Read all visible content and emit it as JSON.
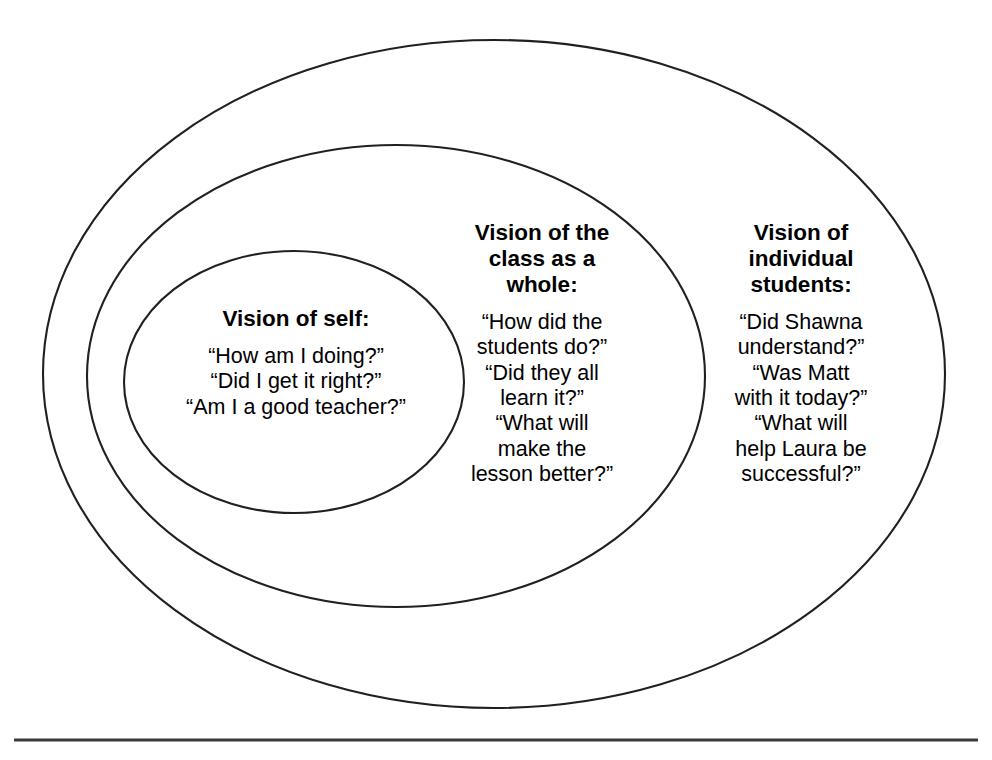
{
  "diagram": {
    "type": "nested-ellipses",
    "title_present": false,
    "stroke_color": "#231f20",
    "background_color": "#ffffff",
    "baseline_rule_color": "#3a3a3a",
    "rings": [
      {
        "id": "inner",
        "name": "vision-of-self",
        "heading": "Vision of self:",
        "questions": [
          "“How am I doing?”",
          "“Did I get it right?”",
          "“Am I a good teacher?”"
        ],
        "geometry": {
          "cx": 294,
          "cy": 382,
          "rx": 170,
          "ry": 131
        }
      },
      {
        "id": "middle",
        "name": "vision-of-the-class-as-a-whole",
        "heading": "Vision of the class as a whole:",
        "heading_lines": [
          "Vision of the",
          "class as a",
          "whole:"
        ],
        "questions": [
          "“How did the students do?”",
          "“Did they all learn it?”",
          "“What will make the lesson better?”"
        ],
        "question_lines": [
          [
            "“How did the",
            "students do?”"
          ],
          [
            "“Did they all",
            "learn it?”"
          ],
          [
            "“What will",
            "make the",
            "lesson better?”"
          ]
        ],
        "geometry": {
          "cx": 396,
          "cy": 376,
          "rx": 309,
          "ry": 231
        }
      },
      {
        "id": "outer",
        "name": "vision-of-individual-students",
        "heading": "Vision of individual students:",
        "heading_lines": [
          "Vision of",
          "individual",
          "students:"
        ],
        "questions": [
          "“Did Shawna understand?”",
          "“Was Matt with it today?”",
          "“What will help Laura be successful?”"
        ],
        "question_lines": [
          [
            "“Did Shawna",
            "understand?”"
          ],
          [
            "“Was Matt",
            "with it today?”"
          ],
          [
            "“What will",
            "help Laura be",
            "successful?”"
          ]
        ],
        "geometry": {
          "cx": 494,
          "cy": 374,
          "rx": 451,
          "ry": 334
        }
      }
    ],
    "baseline": {
      "x1": 14,
      "x2": 978,
      "y": 740
    }
  },
  "self": {
    "heading": "Vision of self:",
    "q1": "“How am I doing?”",
    "q2": "“Did I get it right?”",
    "q3": "“Am I a good teacher?”"
  },
  "klass": {
    "heading_l1": "Vision of the",
    "heading_l2": "class as a",
    "heading_l3": "whole:",
    "q1_l1": "“How did the",
    "q1_l2": "students do?”",
    "q2_l1": "“Did they all",
    "q2_l2": "learn it?”",
    "q3_l1": "“What will",
    "q3_l2": "make the",
    "q3_l3": "lesson better?”"
  },
  "students": {
    "heading_l1": "Vision of",
    "heading_l2": "individual",
    "heading_l3": "students:",
    "q1_l1": "“Did Shawna",
    "q1_l2": "understand?”",
    "q2_l1": "“Was Matt",
    "q2_l2": "with it today?”",
    "q3_l1": "“What will",
    "q3_l2": "help Laura be",
    "q3_l3": "successful?”"
  }
}
